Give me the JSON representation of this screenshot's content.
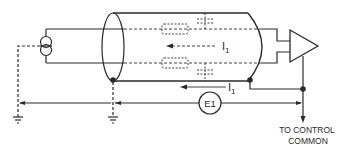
{
  "diagram": {
    "kind": "shielded cable ground-loop schematic",
    "colors": {
      "ink": "#2a2a2a",
      "background": "#ffffff"
    },
    "labels": {
      "current_inner": "I",
      "current_inner_sub": "1",
      "current_shield": "I",
      "current_shield_sub": "1",
      "voltage_source": "E1",
      "destination_line1": "TO CONTROL",
      "destination_line2": "COMMON"
    },
    "components": [
      {
        "id": "current-source",
        "symbol": "two overlapping circles (transducer source)"
      },
      {
        "id": "shielded-cable",
        "symbol": "cylinder with two inner conductors"
      },
      {
        "id": "stray-capacitance",
        "symbol": "dashed capacitors between conductors and shield",
        "count": 2
      },
      {
        "id": "leakage-impedance",
        "symbol": "dashed boxes on inner conductors",
        "count": 2
      },
      {
        "id": "amplifier",
        "symbol": "triangle"
      },
      {
        "id": "ground-left",
        "symbol": "earth ground"
      },
      {
        "id": "ground-shield",
        "symbol": "earth ground"
      },
      {
        "id": "voltage-e1",
        "symbol": "circle labeled E1"
      }
    ]
  }
}
